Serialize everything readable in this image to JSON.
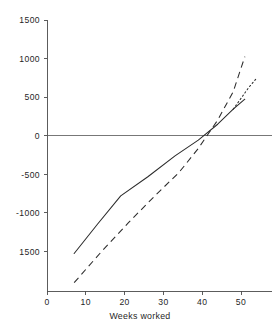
{
  "chart_data": {
    "type": "line",
    "title": "",
    "xlabel": "Weeks worked",
    "ylabel": "",
    "xlim": [
      0,
      58
    ],
    "ylim": [
      -1750,
      1500
    ],
    "grid": false,
    "legend": "none",
    "reference_lines": [
      {
        "name": "zero-line",
        "axis": "y",
        "value": 0
      }
    ],
    "x_ticks": [
      0,
      10,
      20,
      30,
      40,
      50
    ],
    "x_tick_labels": [
      "0",
      "10",
      "20",
      "30",
      "40",
      "50"
    ],
    "y_ticks": [
      1500,
      1000,
      500,
      0,
      -500,
      -1000,
      -1500
    ],
    "y_tick_labels": [
      "1500",
      "1000",
      "500",
      "0",
      "-500",
      "-1000",
      "1500"
    ],
    "series": [
      {
        "name": "solid-curve",
        "style": "solid",
        "color": "#2b2b2b",
        "x": [
          7,
          13,
          19,
          26,
          33,
          39,
          44,
          48,
          51
        ],
        "values": [
          -1300,
          -950,
          -610,
          -380,
          -130,
          60,
          250,
          430,
          550
        ]
      },
      {
        "name": "dashed-curve",
        "style": "dashed",
        "color": "#2b2b2b",
        "x": [
          7,
          14,
          21,
          28,
          34,
          39,
          44,
          48,
          51
        ],
        "values": [
          -1650,
          -1280,
          -930,
          -600,
          -330,
          -40,
          300,
          640,
          1060
        ]
      },
      {
        "name": "dotted-curve",
        "style": "dotted",
        "color": "#2b2b2b",
        "x": [
          48,
          50,
          52,
          54
        ],
        "values": [
          430,
          560,
          690,
          800
        ]
      }
    ]
  },
  "axis": {
    "x_title": "Weeks worked"
  }
}
